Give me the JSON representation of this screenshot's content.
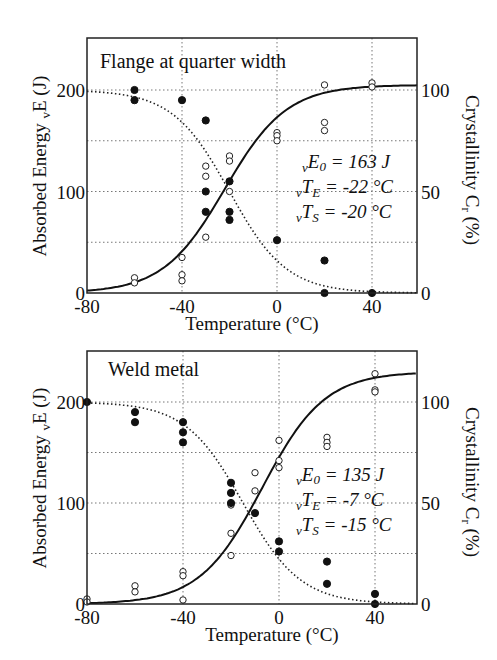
{
  "chart_data": [
    {
      "type": "scatter",
      "title": "Flange at quarter width",
      "xlabel": "Temperature (°C)",
      "ylabel": "Absorbed Energy vE (J)",
      "y2label": "Crystallinity Cr (%)",
      "xlim": [
        -80,
        59
      ],
      "ylim": [
        0,
        251
      ],
      "y2lim": [
        0,
        125
      ],
      "xticks": [
        -80,
        -40,
        0,
        40
      ],
      "yticks": [
        0,
        100,
        200
      ],
      "y2ticks": [
        0,
        50,
        100
      ],
      "grid": true,
      "params": {
        "E0": "vE0 = 163 J",
        "TE": "vTE = -22 °C",
        "TS": "vTS = -20 °C"
      },
      "series": [
        {
          "name": "Absorbed energy (open circles)",
          "marker": "open",
          "points": [
            [
              -60,
              15
            ],
            [
              -60,
              10
            ],
            [
              -40,
              35
            ],
            [
              -40,
              18
            ],
            [
              -40,
              12
            ],
            [
              -30,
              125
            ],
            [
              -30,
              115
            ],
            [
              -30,
              55
            ],
            [
              -20,
              135
            ],
            [
              -20,
              130
            ],
            [
              -20,
              100
            ],
            [
              0,
              158
            ],
            [
              0,
              155
            ],
            [
              0,
              150
            ],
            [
              20,
              205
            ],
            [
              20,
              168
            ],
            [
              20,
              160
            ],
            [
              40,
              207
            ],
            [
              40,
              203
            ]
          ]
        },
        {
          "name": "Crystallinity (filled circles)",
          "marker": "filled",
          "points": [
            [
              -60,
              200
            ],
            [
              -60,
              190
            ],
            [
              -40,
              190
            ],
            [
              -30,
              170
            ],
            [
              -30,
              100
            ],
            [
              -30,
              80
            ],
            [
              -20,
              110
            ],
            [
              -20,
              80
            ],
            [
              -20,
              72
            ],
            [
              0,
              52
            ],
            [
              20,
              32
            ],
            [
              20,
              0
            ],
            [
              40,
              0
            ]
          ]
        },
        {
          "name": "Energy transition curve (solid)",
          "style": "solid",
          "E0": 163,
          "T": -22,
          "upper": 205
        },
        {
          "name": "Crystallinity curve (dotted)",
          "style": "dotted",
          "T": -20,
          "upper": 200
        }
      ]
    },
    {
      "type": "scatter",
      "title": "Weld metal",
      "xlabel": "Temperature (°C)",
      "ylabel": "Absorbed Energy vE (J)",
      "y2label": "Crystallinity Cr (%)",
      "xlim": [
        -80,
        57
      ],
      "ylim": [
        0,
        250
      ],
      "y2lim": [
        0,
        125
      ],
      "xticks": [
        -80,
        -40,
        0,
        40
      ],
      "yticks": [
        0,
        100,
        200
      ],
      "y2ticks": [
        0,
        50,
        100
      ],
      "grid": true,
      "params": {
        "E0": "vE0 = 135 J",
        "TE": "vTE = -7 °C",
        "TS": "vTS = -15 °C"
      },
      "series": [
        {
          "name": "Absorbed energy (open circles)",
          "marker": "open",
          "points": [
            [
              -80,
              5
            ],
            [
              -80,
              2
            ],
            [
              -60,
              18
            ],
            [
              -60,
              12
            ],
            [
              -40,
              32
            ],
            [
              -40,
              28
            ],
            [
              -40,
              4
            ],
            [
              -20,
              98
            ],
            [
              -20,
              70
            ],
            [
              -20,
              48
            ],
            [
              -10,
              130
            ],
            [
              -10,
              112
            ],
            [
              0,
              162
            ],
            [
              0,
              142
            ],
            [
              0,
              135
            ],
            [
              20,
              165
            ],
            [
              20,
              160
            ],
            [
              20,
              156
            ],
            [
              40,
              228
            ],
            [
              40,
              212
            ],
            [
              40,
              210
            ]
          ]
        },
        {
          "name": "Crystallinity (filled circles)",
          "marker": "filled",
          "points": [
            [
              -80,
              200
            ],
            [
              -60,
              190
            ],
            [
              -60,
              180
            ],
            [
              -40,
              180
            ],
            [
              -40,
              170
            ],
            [
              -40,
              160
            ],
            [
              -20,
              120
            ],
            [
              -20,
              110
            ],
            [
              -20,
              100
            ],
            [
              -10,
              90
            ],
            [
              0,
              62
            ],
            [
              0,
              52
            ],
            [
              20,
              42
            ],
            [
              20,
              20
            ],
            [
              40,
              10
            ],
            [
              40,
              0
            ]
          ]
        },
        {
          "name": "Energy transition curve (solid)",
          "style": "solid",
          "E0": 135,
          "T": -7,
          "upper": 230
        },
        {
          "name": "Crystallinity curve (dotted)",
          "style": "dotted",
          "T": -15,
          "upper": 200
        }
      ]
    }
  ],
  "labels": {
    "top_title": "Flange at quarter width",
    "bottom_title": "Weld metal",
    "xlabel": "Temperature (°C)",
    "ylabel_main": "Absorbed Energy ",
    "ylabel_sub": "v",
    "ylabel_end": "E (J)",
    "y2label_main": "Crystallinity C",
    "y2label_sub": "r",
    "y2label_end": " (%)",
    "xticks": [
      "-80",
      "-40",
      "0",
      "40"
    ],
    "yticks": [
      "0",
      "100",
      "200"
    ],
    "y2ticks": [
      "0",
      "50",
      "100"
    ],
    "top_params": [
      {
        "pre": "v",
        "sym": "E",
        "sub": "0",
        "rest": " = 163 J"
      },
      {
        "pre": "v",
        "sym": "T",
        "sub": "E",
        "rest": " = -22 °C"
      },
      {
        "pre": "v",
        "sym": "T",
        "sub": "S",
        "rest": " = -20 °C"
      }
    ],
    "bottom_params": [
      {
        "pre": "v",
        "sym": "E",
        "sub": "0",
        "rest": " = 135 J"
      },
      {
        "pre": "v",
        "sym": "T",
        "sub": "E",
        "rest": " = -7 °C"
      },
      {
        "pre": "v",
        "sym": "T",
        "sub": "S",
        "rest": " = -15 °C"
      }
    ]
  }
}
